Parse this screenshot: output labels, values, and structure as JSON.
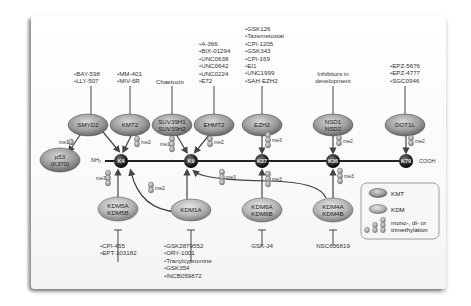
{
  "diagram": {
    "title": "",
    "backbone": {
      "n_term": "NH₂",
      "c_term": "COOH"
    },
    "residues": [
      {
        "id": "K4",
        "label": "K4"
      },
      {
        "id": "K9",
        "label": "K9"
      },
      {
        "id": "K27",
        "label": "K27"
      },
      {
        "id": "K36",
        "label": "K36"
      },
      {
        "id": "K79",
        "label": "K79"
      }
    ],
    "substrate": {
      "label_line1": "p53",
      "label_line2": "(K370)"
    },
    "kmt": [
      {
        "name_line1": "SMYD2",
        "name_line2": "",
        "inhibitors": [
          "BAY-598",
          "LLY-507"
        ],
        "mark": "me1",
        "target": "p53 (K370)"
      },
      {
        "name_line1": "KMT2",
        "name_line2": "",
        "inhibitors": [
          "MM-401",
          "MIV-6R"
        ],
        "mark": "me2",
        "target": "K4"
      },
      {
        "name_line1": "SUV39H1",
        "name_line2": "SUV39H2",
        "inhibitor_text": "Chaetocin",
        "mark": "me1",
        "target": "K9"
      },
      {
        "name_line1": "EHMT2",
        "name_line2": "",
        "inhibitors": [
          "A-366",
          "BIX-01294",
          "UNC0638",
          "UNC0642",
          "UNC0224",
          "E72"
        ],
        "mark": "me2",
        "target": "K9"
      },
      {
        "name_line1": "EZH2",
        "name_line2": "",
        "inhibitors": [
          "GSK126",
          "Tazemetostat",
          "CPI-1205",
          "GSK343",
          "CPI-169",
          "EI1",
          "UNC1999",
          "SAH-EZH2"
        ],
        "mark": "me3",
        "target": "K27"
      },
      {
        "name_line1": "NSD1",
        "name_line2": "NSD2",
        "inhibitor_text_line1": "Inhibitors in",
        "inhibitor_text_line2": "development",
        "mark": "me2",
        "target": "K36"
      },
      {
        "name_line1": "DOT1L",
        "name_line2": "",
        "inhibitors": [
          "EPZ-5676",
          "EPZ-4777",
          "SGC0946"
        ],
        "mark": "me2",
        "target": "K79"
      }
    ],
    "kdm": [
      {
        "name_line1": "KDM5A",
        "name_line2": "KDM5B",
        "inhibitors": [
          "CPI-455",
          "EPT-103182"
        ],
        "mark": "me3",
        "target": "K4"
      },
      {
        "name_line1": "KDM1A",
        "name_line2": "",
        "inhibitors": [
          "GSK2879552",
          "ORY-1001",
          "Tranylcypromine",
          "GSK354",
          "INCB059872"
        ],
        "mark": "me2",
        "targets": [
          "K4",
          "K9"
        ]
      },
      {
        "name_line1": "KDM6A",
        "name_line2": "KDM6B",
        "inhibitors": [
          "GSK-J4"
        ],
        "mark": "me3",
        "target": "K27"
      },
      {
        "name_line1": "KDM4A",
        "name_line2": "KDM4B",
        "inhibitors": [
          "NSC636819"
        ],
        "mark": "me3",
        "targets": [
          "K36",
          "K9"
        ]
      }
    ],
    "k9_mark": "me3",
    "legend": {
      "kmt_label": "KMT",
      "kdm_label": "KDM",
      "methyl_label_line1": "mono-, di- or",
      "methyl_label_line2": "trimethylation"
    },
    "colors": {
      "kmt_fill": "#9a9a9a",
      "kdm_fill": "#b4b4b4",
      "residue_fill": "#2a2a2a",
      "line": "#222222",
      "arrow": "#444444"
    }
  }
}
